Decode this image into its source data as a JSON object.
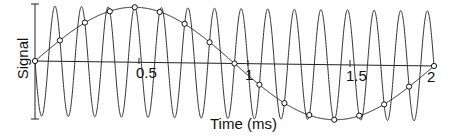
{
  "chart_data": {
    "type": "line",
    "title": "",
    "xlabel": "Time (ms)",
    "ylabel": "Signal",
    "xlim": [
      0,
      2
    ],
    "x_ticks": [
      "0.5",
      "1",
      "1.5",
      "2"
    ],
    "grid": false,
    "legend": null,
    "series": [
      {
        "name": "high-frequency sine",
        "frequency_khz": 7.5,
        "amplitude": 1,
        "style": "thin gray line",
        "description": "Rapid oscillation, ~15 cycles over 0-2 ms"
      },
      {
        "name": "aliased low-frequency sine",
        "frequency_khz": 0.5,
        "amplitude": 1,
        "style": "black line with circle markers at sample points",
        "description": "One full cycle over 0-2 ms, peak at 0.5 ms, trough at 1.5 ms"
      },
      {
        "name": "samples",
        "sample_interval_ms": 0.125,
        "x": [
          0,
          0.125,
          0.25,
          0.375,
          0.5,
          0.625,
          0.75,
          0.875,
          1.0,
          1.125,
          1.25,
          1.375,
          1.5,
          1.625,
          1.75,
          1.875,
          2.0
        ],
        "y": [
          0,
          0.38,
          0.71,
          0.92,
          1.0,
          0.92,
          0.71,
          0.38,
          0,
          -0.38,
          -0.71,
          -0.92,
          -1.0,
          -0.92,
          -0.71,
          -0.38,
          0
        ]
      }
    ]
  },
  "labels": {
    "ylabel": "Signal",
    "xlabel": "Time (ms)",
    "tick_0_5": "0.5",
    "tick_1": "1",
    "tick_1_5": "1.5",
    "tick_2": "2"
  }
}
